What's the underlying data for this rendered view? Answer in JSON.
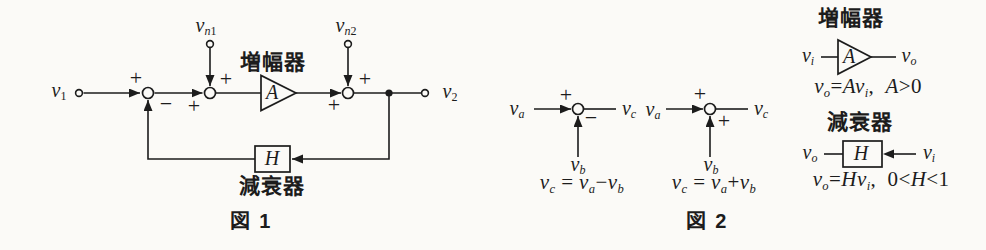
{
  "colors": {
    "ink": "#1c1c1c",
    "paper": "#fbfaf7"
  },
  "fig1": {
    "caption": "図 1",
    "amplifier_label": "増幅器",
    "attenuator_label": "減衰器",
    "amplifier_gain": [
      [
        "A",
        "i"
      ]
    ],
    "attenuator_gain": [
      [
        "H",
        "i"
      ]
    ],
    "input_label": [
      [
        "v",
        "i"
      ],
      [
        "1",
        "sn"
      ]
    ],
    "output_label": [
      [
        "v",
        "i"
      ],
      [
        "2",
        "sn"
      ]
    ],
    "noise1_label": [
      [
        "v",
        "i"
      ],
      [
        "n",
        "si"
      ],
      [
        "1",
        "sn"
      ]
    ],
    "noise2_label": [
      [
        "v",
        "i"
      ],
      [
        "n",
        "si"
      ],
      [
        "2",
        "sn"
      ]
    ],
    "sum1_plus": "+",
    "sum1_minus": "−",
    "sum2_input_plus": "+",
    "sum2_noise_plus": "+",
    "sum3_input_plus": "+",
    "sum3_noise_plus": "+"
  },
  "fig2": {
    "caption": "図 2",
    "subtractor": {
      "input_a": [
        [
          "v",
          "i"
        ],
        [
          "a",
          "si"
        ]
      ],
      "input_b": [
        [
          "v",
          "i"
        ],
        [
          "b",
          "si"
        ]
      ],
      "output_c": [
        [
          "v",
          "i"
        ],
        [
          "c",
          "si"
        ]
      ],
      "plus_sign": "+",
      "minus_sign": "−",
      "equation": [
        [
          "v",
          "i"
        ],
        [
          "c",
          "si"
        ],
        [
          " = ",
          "n"
        ],
        [
          "v",
          "i"
        ],
        [
          "a",
          "si"
        ],
        [
          "−",
          "n"
        ],
        [
          "v",
          "i"
        ],
        [
          "b",
          "si"
        ]
      ]
    },
    "adder": {
      "input_a": [
        [
          "v",
          "i"
        ],
        [
          "a",
          "si"
        ]
      ],
      "input_b": [
        [
          "v",
          "i"
        ],
        [
          "b",
          "si"
        ]
      ],
      "output_c": [
        [
          "v",
          "i"
        ],
        [
          "c",
          "si"
        ]
      ],
      "plus_sign_top": "+",
      "plus_sign_side": "+",
      "equation": [
        [
          "v",
          "i"
        ],
        [
          "c",
          "si"
        ],
        [
          " = ",
          "n"
        ],
        [
          "v",
          "i"
        ],
        [
          "a",
          "si"
        ],
        [
          "+",
          "n"
        ],
        [
          "v",
          "i"
        ],
        [
          "b",
          "si"
        ]
      ]
    },
    "amplifier": {
      "title": "増幅器",
      "gain": [
        [
          "A",
          "i"
        ]
      ],
      "input": [
        [
          "v",
          "i"
        ],
        [
          "i",
          "si"
        ]
      ],
      "output": [
        [
          "v",
          "i"
        ],
        [
          "o",
          "si"
        ]
      ],
      "equation": [
        [
          "v",
          "i"
        ],
        [
          "o",
          "si"
        ],
        [
          "=",
          "n"
        ],
        [
          "A",
          "i"
        ],
        [
          "v",
          "i"
        ],
        [
          "i",
          "si"
        ],
        [
          ",  ",
          "n"
        ],
        [
          "A",
          "i"
        ],
        [
          ">",
          "n"
        ],
        [
          "0",
          "n"
        ]
      ]
    },
    "attenuator": {
      "title": "減衰器",
      "gain": [
        [
          "H",
          "i"
        ]
      ],
      "input": [
        [
          "v",
          "i"
        ],
        [
          "i",
          "si"
        ]
      ],
      "output": [
        [
          "v",
          "i"
        ],
        [
          "o",
          "si"
        ]
      ],
      "equation": [
        [
          "v",
          "i"
        ],
        [
          "o",
          "si"
        ],
        [
          "=",
          "n"
        ],
        [
          "H",
          "i"
        ],
        [
          "v",
          "i"
        ],
        [
          "i",
          "si"
        ],
        [
          ",  ",
          "n"
        ],
        [
          "0",
          "n"
        ],
        [
          "<",
          "n"
        ],
        [
          "H",
          "i"
        ],
        [
          "<",
          "n"
        ],
        [
          "1",
          "n"
        ]
      ]
    }
  }
}
